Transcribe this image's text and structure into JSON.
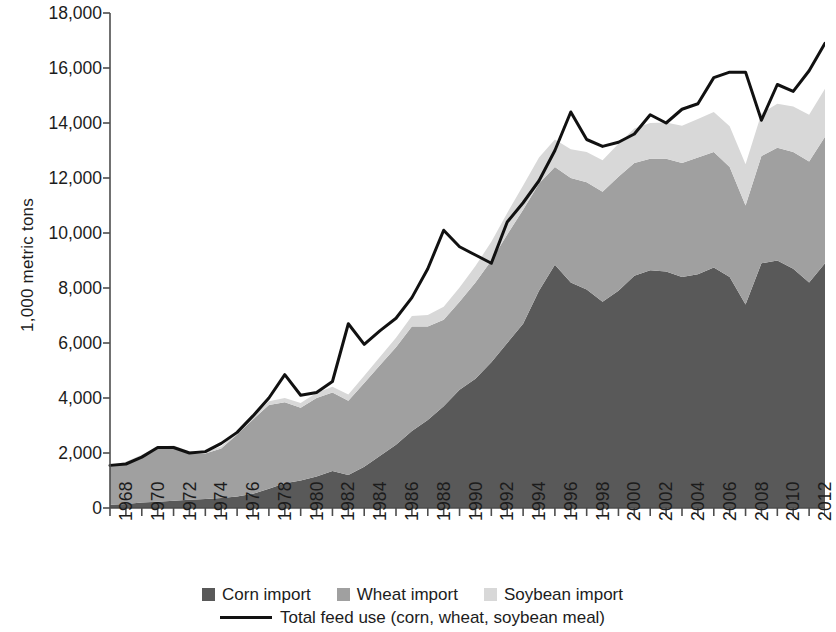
{
  "chart_data": {
    "type": "area",
    "stacked": true,
    "title": "",
    "xlabel": "",
    "ylabel": "1,000 metric tons",
    "ylim": [
      0,
      18000
    ],
    "ytick_labels": [
      "18,000",
      "16,000",
      "14,000",
      "12,000",
      "10,000",
      "8,000",
      "6,000",
      "4,000",
      "2,000",
      "0"
    ],
    "ytick_values": [
      18000,
      16000,
      14000,
      12000,
      10000,
      8000,
      6000,
      4000,
      2000,
      0
    ],
    "ytick_interval": 2000,
    "xlim": [
      1968,
      2013
    ],
    "xtick_labels": [
      "1968",
      "1970",
      "1972",
      "1974",
      "1976",
      "1978",
      "1980",
      "1982",
      "1984",
      "1986",
      "1988",
      "1990",
      "1992",
      "1994",
      "1996",
      "1998",
      "2000",
      "2002",
      "2004",
      "2006",
      "2008",
      "2010",
      "2012"
    ],
    "x": [
      1968,
      1969,
      1970,
      1971,
      1972,
      1973,
      1974,
      1975,
      1976,
      1977,
      1978,
      1979,
      1980,
      1981,
      1982,
      1983,
      1984,
      1985,
      1986,
      1987,
      1988,
      1989,
      1990,
      1991,
      1992,
      1993,
      1994,
      1995,
      1996,
      1997,
      1998,
      1999,
      2000,
      2001,
      2002,
      2003,
      2004,
      2005,
      2006,
      2007,
      2008,
      2009,
      2010,
      2011,
      2012,
      2013
    ],
    "grid": false,
    "legend_position": "bottom",
    "series": [
      {
        "name": "Corn import",
        "color": "#595959",
        "values": [
          120,
          150,
          200,
          230,
          260,
          300,
          330,
          360,
          420,
          520,
          700,
          900,
          1000,
          1150,
          1350,
          1200,
          1500,
          1900,
          2300,
          2800,
          3200,
          3700,
          4300,
          4700,
          5300,
          6000,
          6700,
          7900,
          8850,
          8200,
          7950,
          7500,
          7900,
          8450,
          8650,
          8600,
          8400,
          8500,
          8750,
          8400,
          7400,
          8900,
          9000,
          8700,
          8200,
          8900
        ]
      },
      {
        "name": "Wheat import",
        "color": "#a0a0a0",
        "values": [
          1400,
          1500,
          1700,
          1950,
          1950,
          1700,
          1650,
          1800,
          2250,
          2700,
          3050,
          2950,
          2650,
          2850,
          2850,
          2700,
          3050,
          3300,
          3550,
          3800,
          3400,
          3150,
          3200,
          3500,
          3700,
          3950,
          4150,
          3900,
          3550,
          3800,
          3900,
          4000,
          4150,
          4100,
          4050,
          4100,
          4150,
          4250,
          4200,
          4000,
          3600,
          3900,
          4100,
          4250,
          4400,
          4600
        ]
      },
      {
        "name": "Soybean import",
        "color": "#d8d8d8",
        "values": [
          20,
          30,
          40,
          50,
          60,
          60,
          70,
          80,
          90,
          110,
          130,
          150,
          170,
          190,
          210,
          230,
          260,
          300,
          340,
          380,
          420,
          470,
          520,
          600,
          680,
          780,
          880,
          950,
          1000,
          1050,
          1100,
          1150,
          1200,
          1250,
          1300,
          1320,
          1350,
          1400,
          1450,
          1480,
          1500,
          1550,
          1600,
          1650,
          1700,
          1750
        ]
      }
    ],
    "line_series": {
      "name": "Total feed use (corn, wheat, soybean meal)",
      "color": "#111111",
      "values": [
        1550,
        1600,
        1850,
        2200,
        2200,
        2000,
        2050,
        2350,
        2750,
        3350,
        4000,
        4850,
        4100,
        4200,
        4600,
        6700,
        5950,
        6450,
        6900,
        7650,
        8700,
        10100,
        9500,
        9200,
        8900,
        10400,
        11100,
        11900,
        13000,
        14400,
        13400,
        13150,
        13300,
        13600,
        14300,
        14000,
        14500,
        14700,
        15650,
        15850,
        15850,
        14100,
        15400,
        15150,
        15900,
        16900
      ]
    }
  },
  "legend": {
    "items": [
      {
        "label": "Corn import",
        "swatch": "#595959",
        "marker": "square"
      },
      {
        "label": "Wheat import",
        "swatch": "#a0a0a0",
        "marker": "square"
      },
      {
        "label": "Soybean import",
        "swatch": "#d8d8d8",
        "marker": "square"
      }
    ],
    "line_item": {
      "label": "Total feed use (corn, wheat, soybean meal)",
      "color": "#111111",
      "marker": "line"
    }
  },
  "axis": {
    "color": "#4d4d4d",
    "tick_color": "#4d4d4d"
  }
}
